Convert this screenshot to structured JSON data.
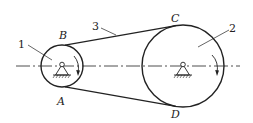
{
  "diagram": {
    "type": "belt-drive",
    "labels": {
      "small_pulley": "1",
      "large_pulley": "2",
      "belt": "3",
      "point_A": "A",
      "point_B": "B",
      "point_C": "C",
      "point_D": "D"
    },
    "colors": {
      "stroke": "#222222",
      "background": "#ffffff"
    }
  }
}
